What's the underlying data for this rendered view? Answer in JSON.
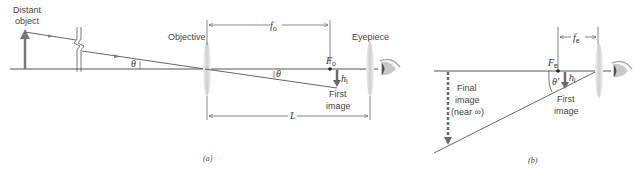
{
  "panel_a": {
    "caption": "(a)",
    "labels": {
      "object_line1": "Distant",
      "object_line2": "object",
      "objective": "Objective",
      "eyepiece": "Eyepiece",
      "focal_length_symbol": "f",
      "focal_length_sub": "o",
      "focal_point_symbol": "F",
      "focal_point_sub": "o",
      "image_height_symbol": "h",
      "image_height_sub": "i",
      "angle_at_object": "θ",
      "angle_at_objective": "θ",
      "first_image_line1": "First",
      "first_image_line2": "image",
      "length": "L"
    }
  },
  "panel_b": {
    "caption": "(b)",
    "labels": {
      "focal_length_symbol": "f",
      "focal_length_sub": "e",
      "focal_point_symbol": "F",
      "focal_point_sub": "e",
      "image_height_symbol": "h",
      "image_height_sub": "i",
      "angle": "θ′",
      "first_image_line1": "First",
      "first_image_line2": "image",
      "final_image_line1": "Final",
      "final_image_line2": "image",
      "final_image_line3": "(near ∞)"
    }
  },
  "colors": {
    "line": "#555555",
    "arrow": "#6b6b6b",
    "lens": "#d9d9d9"
  }
}
